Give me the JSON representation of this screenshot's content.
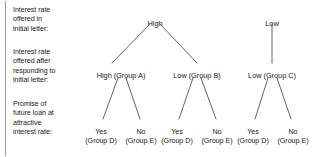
{
  "row_labels": [
    {
      "id": "tier1",
      "text": "Interest rate\noffered in\ninitial letter:"
    },
    {
      "id": "tier2",
      "text": "Interest rate\noffered after\nresponding to\ninitial letter:"
    },
    {
      "id": "tier3",
      "text": "Promise of\nfuture loan at\nattractive\ninterest rate:"
    }
  ],
  "tier1": [
    {
      "id": "high-root",
      "label": "High",
      "x": 155,
      "y": 19
    },
    {
      "id": "low-root",
      "label": "Low",
      "x": 272,
      "y": 19
    }
  ],
  "tier2": [
    {
      "id": "high-group-a",
      "label": "High (Group A)",
      "x": 121,
      "y": 71
    },
    {
      "id": "low-group-b",
      "label": "Low (Group B)",
      "x": 197,
      "y": 71
    },
    {
      "id": "low-group-c",
      "label": "Low (Group C)",
      "x": 272,
      "y": 71
    }
  ],
  "tier3": [
    {
      "id": "leaf-1",
      "answer": "Yes",
      "group": "(Group D)",
      "x": 101,
      "y": 127
    },
    {
      "id": "leaf-2",
      "answer": "No",
      "group": "(Group E)",
      "x": 141,
      "y": 127
    },
    {
      "id": "leaf-3",
      "answer": "Yes",
      "group": "(Group D)",
      "x": 177,
      "y": 127
    },
    {
      "id": "leaf-4",
      "answer": "No",
      "group": "(Group E)",
      "x": 217,
      "y": 127
    },
    {
      "id": "leaf-5",
      "answer": "Yes",
      "group": "(Group D)",
      "x": 253,
      "y": 127
    },
    {
      "id": "leaf-6",
      "answer": "No",
      "group": "(Group E)",
      "x": 293,
      "y": 127
    }
  ],
  "edges": [
    {
      "id": "high-to-a",
      "x1": 150,
      "y1": 24,
      "x2": 112,
      "y2": 63
    },
    {
      "id": "high-to-b",
      "x1": 160,
      "y1": 24,
      "x2": 197,
      "y2": 63
    },
    {
      "id": "low-to-c",
      "x1": 272,
      "y1": 24,
      "x2": 272,
      "y2": 63
    },
    {
      "id": "a-to-leaf1",
      "x1": 118,
      "y1": 78,
      "x2": 103,
      "y2": 119
    },
    {
      "id": "a-to-leaf2",
      "x1": 126,
      "y1": 78,
      "x2": 140,
      "y2": 119
    },
    {
      "id": "b-to-leaf3",
      "x1": 193,
      "y1": 78,
      "x2": 179,
      "y2": 119
    },
    {
      "id": "b-to-leaf4",
      "x1": 201,
      "y1": 78,
      "x2": 216,
      "y2": 119
    },
    {
      "id": "c-to-leaf5",
      "x1": 268,
      "y1": 78,
      "x2": 255,
      "y2": 119
    },
    {
      "id": "c-to-leaf6",
      "x1": 277,
      "y1": 78,
      "x2": 291,
      "y2": 119
    }
  ],
  "colors": {
    "line": "#3b3b3b",
    "rail": "#9a9a9a",
    "text": "#1a1a1a",
    "background": "#ffffff"
  }
}
